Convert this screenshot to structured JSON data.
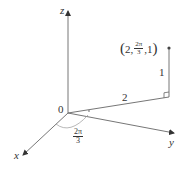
{
  "diagram": {
    "type": "cylindrical-coordinates",
    "axes": {
      "x_label": "x",
      "y_label": "y",
      "z_label": "z",
      "origin_label": "0"
    },
    "point": {
      "prefix": "2,",
      "frac_num": "2π",
      "frac_den": "3",
      "suffix": ",1",
      "open": "(",
      "close": ")"
    },
    "radius_label": "2",
    "height_label": "1",
    "angle": {
      "num": "2π",
      "den": "3"
    },
    "colors": {
      "line": "#555555",
      "text": "#333333"
    }
  }
}
